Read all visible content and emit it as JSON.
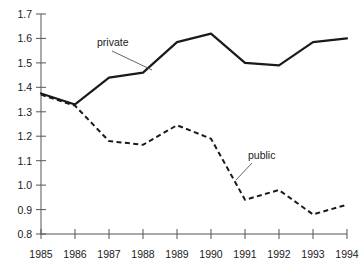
{
  "chart_data": {
    "type": "line",
    "title": "",
    "xlabel": "",
    "ylabel": "",
    "categories": [
      "1985",
      "1986",
      "1987",
      "1988",
      "1989",
      "1990",
      "1991",
      "1992",
      "1993",
      "1994"
    ],
    "x": [
      1985,
      1986,
      1987,
      1988,
      1989,
      1990,
      1991,
      1992,
      1993,
      1994
    ],
    "xlim": [
      1985,
      1994
    ],
    "ylim": [
      0.8,
      1.7
    ],
    "ytick_labels": [
      "1.7",
      "1.6",
      "1.5",
      "1.4",
      "1.3",
      "1.2",
      "1.1",
      "1.0",
      "0.9",
      "0.8"
    ],
    "ytick_values": [
      1.7,
      1.6,
      1.5,
      1.4,
      1.3,
      1.2,
      1.1,
      1.0,
      0.9,
      0.8
    ],
    "grid": false,
    "legend_position": "inline-annotations",
    "series": [
      {
        "name": "private",
        "style": "solid",
        "label": "private",
        "values": [
          1.375,
          1.33,
          1.44,
          1.46,
          1.585,
          1.62,
          1.5,
          1.49,
          1.585,
          1.6
        ]
      },
      {
        "name": "public",
        "style": "dashed",
        "label": "public",
        "values": [
          1.37,
          1.325,
          1.18,
          1.165,
          1.245,
          1.19,
          0.94,
          0.98,
          0.88,
          0.92
        ]
      }
    ],
    "annotations": [
      {
        "text": "private",
        "for_series": "private"
      },
      {
        "text": "public",
        "for_series": "public"
      }
    ],
    "colors": {
      "line": "#1a1a1a",
      "axis": "#555555",
      "text": "#1a1a1a",
      "background": "#ffffff"
    }
  }
}
